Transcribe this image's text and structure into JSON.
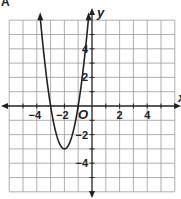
{
  "corner_label": "A",
  "chart_data": {
    "type": "line",
    "title": "",
    "function": "y = 3(x + 2)^2 - 3",
    "xlabel": "x",
    "ylabel": "y",
    "xlim": [
      -6,
      6
    ],
    "ylim": [
      -6,
      6
    ],
    "grid": true,
    "x_tick_labels": [
      "-4",
      "-2",
      "2",
      "4"
    ],
    "y_tick_labels": [
      "4",
      "2",
      "-2",
      "-4"
    ],
    "origin_label": "O",
    "vertex": [
      -2,
      -3
    ],
    "x_intercepts": [
      -3,
      -1
    ],
    "series": [
      {
        "name": "parabola",
        "x": [
          -3.8,
          -3.5,
          -3.0,
          -2.5,
          -2.0,
          -1.5,
          -1.0,
          -0.5,
          -0.2
        ],
        "y": [
          6.72,
          3.75,
          0,
          -2.25,
          -3,
          -2.25,
          0,
          3.75,
          6.72
        ]
      }
    ]
  },
  "colors": {
    "grid": "#9a9a9a",
    "axis": "#222222",
    "curve": "#222222",
    "background": "#ffffff"
  }
}
